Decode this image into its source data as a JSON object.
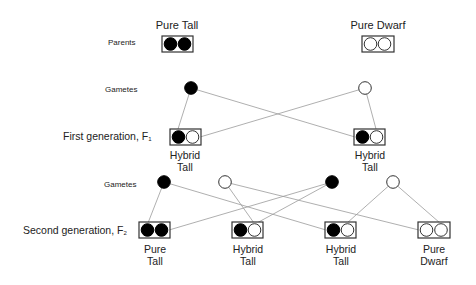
{
  "rows": {
    "parents_label": "Parents",
    "gametes1_label": "Gametes",
    "f1_label": "First generation, F",
    "f1_sub": "1",
    "gametes2_label": "Gametes",
    "f2_label": "Second generation, F",
    "f2_sub": "2"
  },
  "parents": [
    {
      "title": "Pure Tall",
      "alleles": [
        "dominant",
        "dominant"
      ]
    },
    {
      "title": "Pure Dwarf",
      "alleles": [
        "recessive",
        "recessive"
      ]
    }
  ],
  "gametes1": [
    {
      "allele": "dominant"
    },
    {
      "allele": "recessive"
    }
  ],
  "f1": [
    {
      "caption_line1": "Hybrid",
      "caption_line2": "Tall",
      "alleles": [
        "dominant",
        "recessive"
      ]
    },
    {
      "caption_line1": "Hybrid",
      "caption_line2": "Tall",
      "alleles": [
        "dominant",
        "recessive"
      ]
    }
  ],
  "gametes2": [
    {
      "allele": "dominant"
    },
    {
      "allele": "recessive"
    },
    {
      "allele": "dominant"
    },
    {
      "allele": "recessive"
    }
  ],
  "f2": [
    {
      "caption_line1": "Pure",
      "caption_line2": "Tall",
      "alleles": [
        "dominant",
        "dominant"
      ]
    },
    {
      "caption_line1": "Hybrid",
      "caption_line2": "Tall",
      "alleles": [
        "dominant",
        "recessive"
      ]
    },
    {
      "caption_line1": "Hybrid",
      "caption_line2": "Tall",
      "alleles": [
        "dominant",
        "recessive"
      ]
    },
    {
      "caption_line1": "Pure",
      "caption_line2": "Dwarf",
      "alleles": [
        "recessive",
        "recessive"
      ]
    }
  ],
  "colors": {
    "dominant_fill": "#000000",
    "recessive_fill": "#ffffff",
    "stroke": "#333333",
    "connector": "#9a9a9a"
  }
}
